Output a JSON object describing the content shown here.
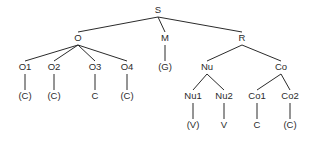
{
  "diagram": {
    "type": "syllable-structure-tree",
    "background_color": "#ffffff",
    "line_color": "#2b2b2b",
    "text_color": "#2b2b2b",
    "nodes": [
      {
        "id": "S",
        "label": "S",
        "x": 158,
        "y": 13,
        "level": 0
      },
      {
        "id": "O",
        "label": "O",
        "x": 78,
        "y": 41,
        "level": 1
      },
      {
        "id": "M",
        "label": "M",
        "x": 165,
        "y": 41,
        "level": 1
      },
      {
        "id": "R",
        "label": "R",
        "x": 242,
        "y": 41,
        "level": 1
      },
      {
        "id": "O1",
        "label": "O1",
        "x": 25,
        "y": 70,
        "level": 2
      },
      {
        "id": "O2",
        "label": "O2",
        "x": 54,
        "y": 70,
        "level": 2
      },
      {
        "id": "O3",
        "label": "O3",
        "x": 95,
        "y": 70,
        "level": 2
      },
      {
        "id": "O4",
        "label": "O4",
        "x": 127,
        "y": 70,
        "level": 2
      },
      {
        "id": "G",
        "label": "(G)",
        "x": 165,
        "y": 70,
        "level": 2
      },
      {
        "id": "Nu",
        "label": "Nu",
        "x": 207,
        "y": 70,
        "level": 2
      },
      {
        "id": "Co",
        "label": "Co",
        "x": 281,
        "y": 70,
        "level": 2
      },
      {
        "id": "C1",
        "label": "(C)",
        "x": 25,
        "y": 99,
        "level": 3
      },
      {
        "id": "C2",
        "label": "(C)",
        "x": 54,
        "y": 99,
        "level": 3
      },
      {
        "id": "C3",
        "label": "C",
        "x": 95,
        "y": 99,
        "level": 3
      },
      {
        "id": "C4",
        "label": "(C)",
        "x": 127,
        "y": 99,
        "level": 3
      },
      {
        "id": "Nu1",
        "label": "Nu1",
        "x": 193,
        "y": 99,
        "level": 3
      },
      {
        "id": "Nu2",
        "label": "Nu2",
        "x": 224,
        "y": 99,
        "level": 3
      },
      {
        "id": "Co1",
        "label": "Co1",
        "x": 257,
        "y": 99,
        "level": 3
      },
      {
        "id": "Co2",
        "label": "Co2",
        "x": 290,
        "y": 99,
        "level": 3
      },
      {
        "id": "V1",
        "label": "(V)",
        "x": 193,
        "y": 128,
        "level": 4
      },
      {
        "id": "V2",
        "label": "V",
        "x": 224,
        "y": 128,
        "level": 4
      },
      {
        "id": "C5",
        "label": "C",
        "x": 257,
        "y": 128,
        "level": 4
      },
      {
        "id": "C6",
        "label": "(C)",
        "x": 290,
        "y": 128,
        "level": 4
      }
    ],
    "edges": [
      {
        "from": "S",
        "to": "O"
      },
      {
        "from": "S",
        "to": "M"
      },
      {
        "from": "S",
        "to": "R"
      },
      {
        "from": "O",
        "to": "O1"
      },
      {
        "from": "O",
        "to": "O2"
      },
      {
        "from": "O",
        "to": "O3"
      },
      {
        "from": "O",
        "to": "O4"
      },
      {
        "from": "M",
        "to": "G"
      },
      {
        "from": "R",
        "to": "Nu"
      },
      {
        "from": "R",
        "to": "Co"
      },
      {
        "from": "O1",
        "to": "C1"
      },
      {
        "from": "O2",
        "to": "C2"
      },
      {
        "from": "O3",
        "to": "C3"
      },
      {
        "from": "O4",
        "to": "C4"
      },
      {
        "from": "Nu",
        "to": "Nu1"
      },
      {
        "from": "Nu",
        "to": "Nu2"
      },
      {
        "from": "Co",
        "to": "Co1"
      },
      {
        "from": "Co",
        "to": "Co2"
      },
      {
        "from": "Nu1",
        "to": "V1"
      },
      {
        "from": "Nu2",
        "to": "V2"
      },
      {
        "from": "Co1",
        "to": "C5"
      },
      {
        "from": "Co2",
        "to": "C6"
      }
    ]
  }
}
